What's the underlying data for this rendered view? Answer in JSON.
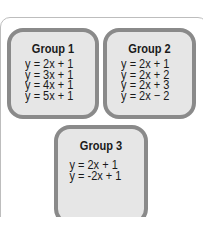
{
  "groups": [
    {
      "title": "Group 1",
      "equations": [
        "y = 2x + 1",
        "y = 3x + 1",
        "y = 4x + 1",
        "y = 5x + 1"
      ]
    },
    {
      "title": "Group 2",
      "equations": [
        "y = 2x + 1",
        "y = 2x + 2",
        "y = 2x + 3",
        "y = 2x − 2"
      ]
    },
    {
      "title": "Group 3",
      "equations": [
        "y = 2x + 1",
        "y = -2x + 1"
      ]
    }
  ],
  "colors": {
    "box_fill": "#e6e6e6",
    "box_border": "#8a8a8a",
    "text": "#1a1a1a"
  }
}
